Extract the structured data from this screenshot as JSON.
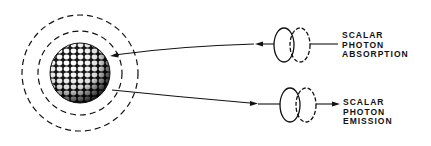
{
  "diagram": {
    "nucleus": {
      "name": "sphere of packed particles",
      "cx": 80,
      "cy": 73,
      "r": 30
    },
    "rings": [
      {
        "name": "inner-dashed-ring",
        "r": 42
      },
      {
        "name": "outer-dashed-ring",
        "r": 58
      }
    ],
    "absorption": {
      "label_lines": [
        "SCALAR",
        "PHOTON",
        "ABSORPTION"
      ],
      "direction": "incoming"
    },
    "emission": {
      "label_lines": [
        "SCALAR",
        "PHOTON",
        "EMISSION"
      ],
      "direction": "outgoing"
    },
    "colors": {
      "ink": "#111111",
      "background": "#ffffff"
    }
  }
}
